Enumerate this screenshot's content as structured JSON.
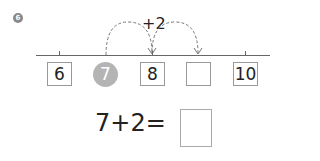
{
  "problem": {
    "number": "6",
    "jump_label": "+2",
    "number_line": {
      "labels": [
        "6",
        "7",
        "8",
        "",
        "10"
      ],
      "highlighted": "7"
    },
    "equation": "7+2=",
    "answer": ""
  }
}
